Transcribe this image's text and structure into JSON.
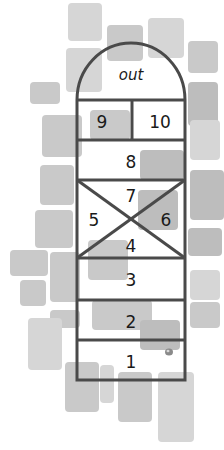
{
  "diagram": {
    "labels": {
      "out": "out",
      "sq9": "9",
      "sq10": "10",
      "sq8": "8",
      "sq7": "7",
      "sq5": "5",
      "sq6": "6",
      "sq4": "4",
      "sq3": "3",
      "sq2": "2",
      "sq1": "1"
    },
    "colors": {
      "line": "#4a4a4a",
      "stone": "#c9c9c9",
      "marker": "#8a8a8a",
      "text": "#1a1a1a"
    },
    "marker": "stone-marker in square 1"
  }
}
